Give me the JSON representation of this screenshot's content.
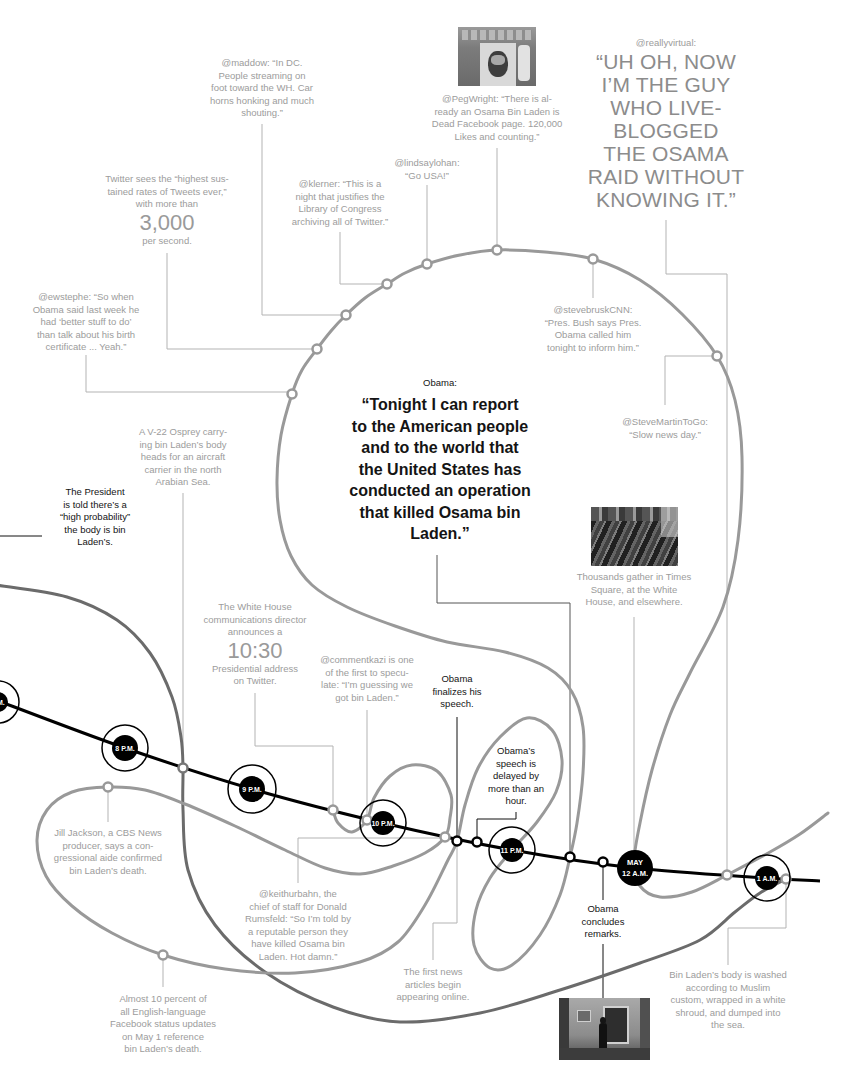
{
  "colors": {
    "background": "#ffffff",
    "thread": "#999999",
    "dark_thread": "#6b6b6b",
    "timeline": "#000000",
    "note_text": "#9c9c9c",
    "event_text": "#141414",
    "leader": "#b3b3b3"
  },
  "timeline": {
    "nodes": [
      {
        "label": "P.M."
      },
      {
        "label": "8 P.M."
      },
      {
        "label": "9 P.M."
      },
      {
        "label": "10 P.M."
      },
      {
        "label": "11 P.M."
      },
      {
        "label_line1": "MAY",
        "label_line2": "12 A.M."
      },
      {
        "label": "1 A.M."
      }
    ]
  },
  "quotes": {
    "reallyvirtual": {
      "handle": "@reallyvirtual:",
      "lines": [
        "“UH OH, NOW",
        "I’M THE GUY",
        "WHO LIVE-",
        "BLOGGED",
        "THE OSAMA",
        "RAID WITHOUT",
        "KNOWING IT.”"
      ]
    },
    "obama": {
      "speaker": "Obama:",
      "lines": [
        "“Tonight I can report",
        "to the American people",
        "and to the world that",
        "the United States has",
        "conducted an operation",
        "that killed Osama bin",
        "Laden.”"
      ]
    }
  },
  "notes": {
    "maddow": {
      "lines": [
        "@maddow: “In DC.",
        "People streaming on",
        "foot toward the WH. Car",
        "horns honking and much",
        "shouting.”"
      ]
    },
    "twitter": {
      "lines": [
        "Twitter sees the “highest sus-",
        "tained rates of Tweets ever,”",
        "with more than"
      ],
      "figure": "3,000",
      "after": [
        "per second."
      ]
    },
    "klerner": {
      "lines": [
        "@klerner: “This is a",
        "night that justifies the",
        "Library of Congress",
        "archiving all of Twitter.”"
      ]
    },
    "lindsaylohan": {
      "lines": [
        "@lindsaylohan:",
        "“Go USA!”"
      ]
    },
    "pegwright": {
      "lines": [
        "@PegWright: “There is al-",
        "ready an Osama Bin Laden is",
        "Dead Facebook page. 120,000",
        "Likes and counting.”"
      ]
    },
    "ewstephe": {
      "lines": [
        "@ewstephe: “So when",
        "Obama said last week he",
        "had ‘better stuff to do’",
        "than talk about his birth",
        "certificate ... Yeah.”"
      ]
    },
    "stevebruskcnn": {
      "lines": [
        "@stevebruskCNN:",
        "“Pres. Bush says Pres.",
        "Obama called him",
        "tonight to inform him.”"
      ]
    },
    "stevemartintogo": {
      "lines": [
        "@SteveMartinToGo:",
        "“Slow news day.”"
      ]
    },
    "osprey": {
      "lines": [
        "A V-22 Osprey carry-",
        "ing bin Laden’s body",
        "heads for an aircraft",
        "carrier in the north",
        "Arabian Sea."
      ]
    },
    "president": {
      "lines": [
        "The President",
        "is told there’s a",
        "“high probability”",
        "the body is bin",
        "Laden’s."
      ]
    },
    "timessquare": {
      "lines": [
        "Thousands gather in Times",
        "Square, at the White",
        "House, and elsewhere."
      ]
    },
    "whitehouse": {
      "lines": [
        "The White House",
        "communications director",
        "announces a"
      ],
      "figure": "10:30",
      "after": [
        "Presidential address",
        "on Twitter."
      ]
    },
    "commentkazi": {
      "lines": [
        "@commentkazi is one",
        "of the first to specu-",
        "late: “I’m guessing we",
        "got bin Laden.”"
      ]
    },
    "finalizes": {
      "lines": [
        "Obama",
        "finalizes his",
        "speech."
      ]
    },
    "delayed": {
      "lines": [
        "Obama’s",
        "speech is",
        "delayed by",
        "more than an",
        "hour."
      ]
    },
    "jilljackson": {
      "lines": [
        "Jill Jackson, a CBS News",
        "producer, says a con-",
        "gressional aide confirmed",
        "bin Laden’s death."
      ]
    },
    "keithurbahn": {
      "lines": [
        "@keithurbahn, the",
        "chief of staff for Donald",
        "Rumsfeld: “So I’m told by",
        "a reputable person they",
        "have killed Osama bin",
        "Laden. Hot damn.”"
      ]
    },
    "firstnews": {
      "lines": [
        "The first news",
        "articles begin",
        "appearing online."
      ]
    },
    "concludes": {
      "lines": [
        "Obama",
        "concludes",
        "remarks."
      ]
    },
    "burial": {
      "lines": [
        "Bin Laden’s body is washed",
        "according to Muslim",
        "custom, wrapped in a white",
        "shroud, and dumped into",
        "the sea."
      ]
    },
    "facebook": {
      "lines": [
        "Almost 10 percent of",
        "all English-language",
        "Facebook status updates",
        "on May 1 reference",
        "bin Laden’s death."
      ]
    }
  }
}
